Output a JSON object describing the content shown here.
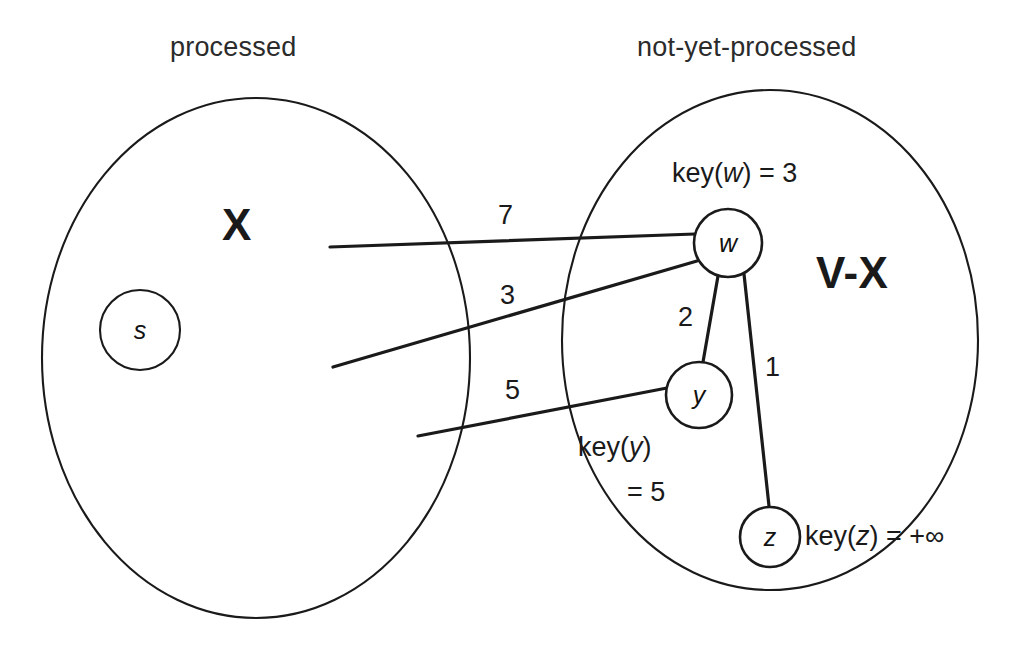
{
  "diagram": {
    "stroke_color": "#1a1a1a",
    "background_color": "#ffffff"
  },
  "set_labels": {
    "left": "processed",
    "right": "not-yet-processed"
  },
  "region_labels": {
    "left": "X",
    "right": "V-X"
  },
  "nodes": [
    {
      "id": "s",
      "label": "s",
      "set": "processed",
      "cx": 140,
      "cy": 330,
      "r": 40
    },
    {
      "id": "w",
      "label": "w",
      "set": "not-yet-processed",
      "cx": 728,
      "cy": 243,
      "r": 34
    },
    {
      "id": "y",
      "label": "y",
      "set": "not-yet-processed",
      "cx": 699,
      "cy": 395,
      "r": 33
    },
    {
      "id": "z",
      "label": "z",
      "set": "not-yet-processed",
      "cx": 770,
      "cy": 537,
      "r": 30
    }
  ],
  "crossing_edges": [
    {
      "id": "edge-7",
      "weight": "7",
      "from": "X",
      "to": "w",
      "label_x": 498,
      "label_y": 200
    },
    {
      "id": "edge-3",
      "weight": "3",
      "from": "X",
      "to": "w",
      "label_x": 500,
      "label_y": 280
    },
    {
      "id": "edge-5",
      "weight": "5",
      "from": "X",
      "to": "y",
      "label_x": 505,
      "label_y": 375
    }
  ],
  "internal_edges": [
    {
      "id": "edge-w-y",
      "weight": "2",
      "from": "w",
      "to": "y",
      "label_x": 678,
      "label_y": 302
    },
    {
      "id": "edge-w-z",
      "weight": "1",
      "from": "w",
      "to": "z",
      "label_x": 765,
      "label_y": 352
    }
  ],
  "keys": {
    "w": {
      "prefix": "key(",
      "var": "w",
      "suffix": ") = 3",
      "value": "3"
    },
    "y": {
      "line1_prefix": "key(",
      "line1_var": "y",
      "line1_suffix": ")",
      "line2": "= 5",
      "value": "5"
    },
    "z": {
      "prefix": "key(",
      "var": "z",
      "suffix": ") = +∞",
      "value": "+∞"
    }
  }
}
